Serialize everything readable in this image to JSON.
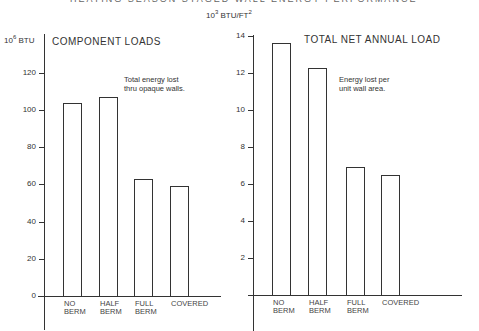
{
  "header": {
    "title": "HEATING SEASON STAGED WALL ENERGY PERFORMANCE"
  },
  "chart_data": [
    {
      "type": "bar",
      "title": "COMPONENT LOADS",
      "annotation": "Total energy lost thru opaque walls.",
      "ylabel": "10^6 BTU",
      "xlabel": "",
      "categories": [
        "NO BERM",
        "HALF BERM",
        "FULL BERM",
        "COVERED"
      ],
      "values": [
        104,
        107,
        63,
        59
      ],
      "ylim": [
        0,
        130
      ],
      "yticks": [
        0,
        20,
        40,
        60,
        80,
        100,
        120
      ],
      "grid": false
    },
    {
      "type": "bar",
      "title": "TOTAL NET ANNUAL LOAD",
      "annotation": "Energy lost per unit wall area.",
      "ylabel": "10^3 BTU/FT^2",
      "xlabel": "",
      "categories": [
        "NO BERM",
        "HALF BERM",
        "FULL BERM",
        "COVERED"
      ],
      "values": [
        13.6,
        12.25,
        6.9,
        6.5
      ],
      "ylim": [
        0,
        14
      ],
      "yticks": [
        2,
        4,
        6,
        8,
        10,
        12,
        14
      ],
      "grid": false
    }
  ],
  "left": {
    "unit_base": "10",
    "unit_exp": "6",
    "unit_rest": " BTU",
    "title": "COMPONENT LOADS",
    "annot_line1": "Total energy lost",
    "annot_line2": "thru opaque walls.",
    "ticks": [
      "0",
      "20",
      "40",
      "60",
      "80",
      "100",
      "120"
    ],
    "cats": [
      "NO\nBERM",
      "HALF\nBERM",
      "FULL\nBERM",
      "COVERED"
    ]
  },
  "right": {
    "unit_base": "10",
    "unit_exp": "3",
    "unit_mid": " BTU/FT",
    "unit_exp2": "2",
    "title": "TOTAL NET ANNUAL LOAD",
    "annot_line1": "Energy lost per",
    "annot_line2": "unit wall area.",
    "ticks": [
      "2",
      "4",
      "6",
      "8",
      "10",
      "12",
      "14"
    ],
    "cats": [
      "NO\nBERM",
      "HALF\nBERM",
      "FULL\nBERM",
      "COVERED"
    ]
  }
}
